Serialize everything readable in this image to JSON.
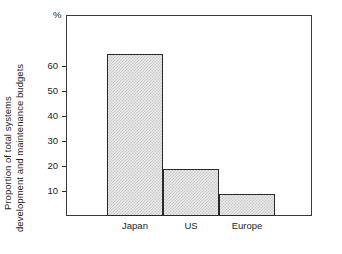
{
  "chart_data": {
    "type": "bar",
    "title": "",
    "subtitle": "",
    "categories": [
      "Japan",
      "US",
      "Europe"
    ],
    "values": [
      65,
      19,
      9
    ],
    "xlabel": "",
    "ylabel": "Proportion of total systems development and maintenance budgets",
    "ylabel_lines": [
      "Proportion of total systems",
      "development and maintenance budgets"
    ],
    "unit": "%",
    "ylim": [
      0,
      70
    ],
    "yticks": [
      10,
      20,
      30,
      40,
      50,
      60
    ],
    "ytick_labels": [
      "10",
      "20",
      "30",
      "40",
      "50",
      "60"
    ],
    "grid": false,
    "legend": null,
    "bar_fill": "#e9e9e9",
    "bar_pattern": "#c9c9c9",
    "bar_edge": "#2a2a2a",
    "frame_color": "#3a3a3a",
    "background": "#ffffff"
  }
}
